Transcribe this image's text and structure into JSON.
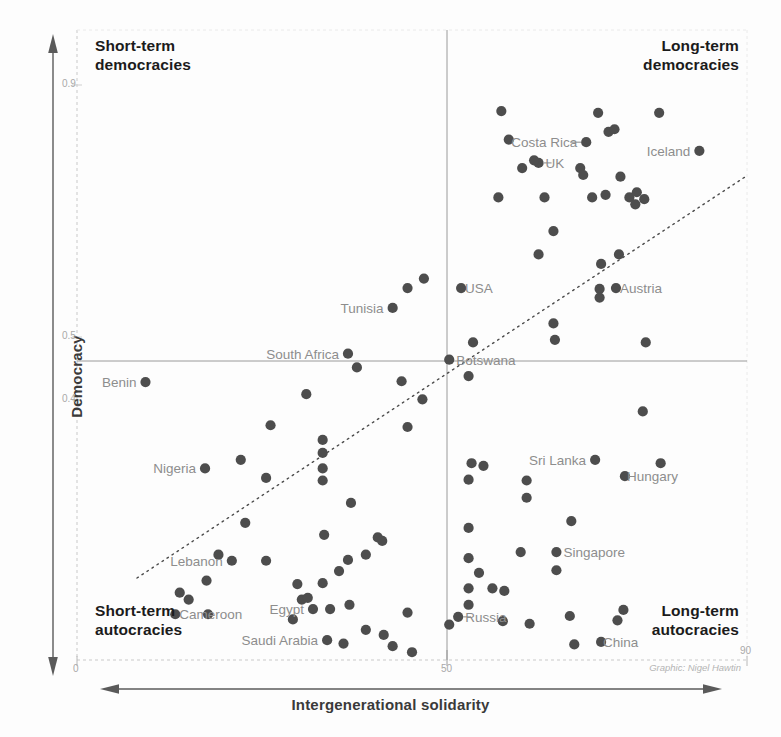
{
  "chart_data": {
    "type": "scatter",
    "title": "",
    "xlabel": "Intergenerational solidarity",
    "ylabel": "Democracy",
    "xlim": [
      0,
      90
    ],
    "ylim": [
      0.23,
      0.96
    ],
    "xticks": [
      "0",
      "50",
      "90"
    ],
    "xtick_values": [
      0,
      50,
      90
    ],
    "yticks": [
      "0.9",
      "0.5",
      "0.4"
    ],
    "ytick_values": [
      0.9,
      0.5,
      0.4
    ],
    "grid": false,
    "legend": null,
    "credit": "Graphic: Nigel Hawtin",
    "reference_lines": {
      "vertical_x": 50,
      "horizontal_y": 0.462,
      "trend_description": "dotted rising diagonal trend line",
      "trend_x": [
        8,
        86
      ],
      "trend_y": [
        0.266,
        0.706
      ]
    },
    "quadrants": {
      "top_left": "Short-term\ndemocracies",
      "top_right": "Long-term\ndemocracies",
      "bottom_left": "Short-term\nautocracies",
      "bottom_right": "Long-term\nautocracies"
    },
    "labeled_points": [
      {
        "name": "Benin",
        "x": 9.2,
        "y": 0.552,
        "anchor": "right",
        "dx": -9
      },
      {
        "name": "Nigeria",
        "x": 17.2,
        "y": 0.452,
        "anchor": "right",
        "dx": -9
      },
      {
        "name": "South Africa",
        "x": 36.4,
        "y": 0.585,
        "anchor": "right",
        "dx": -9
      },
      {
        "name": "Tunisia",
        "x": 42.4,
        "y": 0.638,
        "anchor": "right",
        "dx": -9
      },
      {
        "name": "Lebanon",
        "x": 20.8,
        "y": 0.345,
        "anchor": "right",
        "dx": -9
      },
      {
        "name": "Cameroon",
        "x": 13.2,
        "y": 0.283,
        "anchor": "left",
        "dx": 4
      },
      {
        "name": "Egypt",
        "x": 31.7,
        "y": 0.289,
        "anchor": "right",
        "dx": -9
      },
      {
        "name": "Saudi Arabia",
        "x": 33.6,
        "y": 0.253,
        "anchor": "right",
        "dx": -9
      },
      {
        "name": "USA",
        "x": 51.6,
        "y": 0.661,
        "anchor": "left",
        "dx": 4
      },
      {
        "name": "Botswana",
        "x": 50.0,
        "y": 0.578,
        "anchor": "left",
        "dx": 7
      },
      {
        "name": "Costa Rica",
        "x": 68.4,
        "y": 0.83,
        "anchor": "right",
        "dx": -9
      },
      {
        "name": "UK",
        "x": 62.0,
        "y": 0.806,
        "anchor": "left",
        "dx": 7
      },
      {
        "name": "Iceland",
        "x": 83.6,
        "y": 0.82,
        "anchor": "right",
        "dx": -9
      },
      {
        "name": "Austria",
        "x": 72.4,
        "y": 0.661,
        "anchor": "left",
        "dx": 4
      },
      {
        "name": "Sri Lanka",
        "x": 69.6,
        "y": 0.462,
        "anchor": "right",
        "dx": -9
      },
      {
        "name": "Hungary",
        "x": 73.6,
        "y": 0.443,
        "anchor": "left",
        "dx": 2
      },
      {
        "name": "Singapore",
        "x": 64.4,
        "y": 0.355,
        "anchor": "left",
        "dx": 7
      },
      {
        "name": "Russia",
        "x": 51.2,
        "y": 0.28,
        "anchor": "left",
        "dx": 7
      },
      {
        "name": "China",
        "x": 70.4,
        "y": 0.251,
        "anchor": "left",
        "dx": 2
      }
    ],
    "points": [
      [
        9.2,
        0.552
      ],
      [
        17.2,
        0.452
      ],
      [
        22.0,
        0.462
      ],
      [
        25.4,
        0.441
      ],
      [
        22.6,
        0.389
      ],
      [
        26.0,
        0.502
      ],
      [
        30.8,
        0.538
      ],
      [
        33.2,
        0.375
      ],
      [
        36.4,
        0.585
      ],
      [
        37.6,
        0.569
      ],
      [
        33.0,
        0.485
      ],
      [
        33.0,
        0.47
      ],
      [
        33.0,
        0.452
      ],
      [
        33.0,
        0.438
      ],
      [
        36.8,
        0.412
      ],
      [
        40.4,
        0.372
      ],
      [
        42.4,
        0.638
      ],
      [
        43.6,
        0.553
      ],
      [
        44.4,
        0.5
      ],
      [
        44.4,
        0.661
      ],
      [
        46.6,
        0.672
      ],
      [
        46.4,
        0.532
      ],
      [
        20.8,
        0.345
      ],
      [
        19.0,
        0.352
      ],
      [
        17.4,
        0.322
      ],
      [
        15.0,
        0.3
      ],
      [
        13.8,
        0.308
      ],
      [
        13.2,
        0.283
      ],
      [
        17.6,
        0.283
      ],
      [
        25.4,
        0.345
      ],
      [
        29.6,
        0.318
      ],
      [
        30.2,
        0.3
      ],
      [
        31.0,
        0.302
      ],
      [
        33.0,
        0.319
      ],
      [
        35.2,
        0.333
      ],
      [
        36.4,
        0.346
      ],
      [
        38.8,
        0.352
      ],
      [
        41.0,
        0.368
      ],
      [
        31.7,
        0.289
      ],
      [
        29.0,
        0.277
      ],
      [
        34.0,
        0.289
      ],
      [
        36.6,
        0.294
      ],
      [
        33.6,
        0.253
      ],
      [
        35.8,
        0.249
      ],
      [
        38.8,
        0.265
      ],
      [
        41.2,
        0.259
      ],
      [
        42.4,
        0.246
      ],
      [
        44.4,
        0.285
      ],
      [
        45.0,
        0.239
      ],
      [
        50.0,
        0.578
      ],
      [
        51.6,
        0.661
      ],
      [
        53.2,
        0.598
      ],
      [
        52.6,
        0.559
      ],
      [
        53.0,
        0.458
      ],
      [
        54.6,
        0.455
      ],
      [
        52.6,
        0.439
      ],
      [
        52.6,
        0.383
      ],
      [
        52.6,
        0.348
      ],
      [
        54.0,
        0.331
      ],
      [
        52.6,
        0.313
      ],
      [
        52.6,
        0.294
      ],
      [
        51.2,
        0.28
      ],
      [
        50.0,
        0.271
      ],
      [
        55.8,
        0.313
      ],
      [
        57.4,
        0.31
      ],
      [
        57.2,
        0.275
      ],
      [
        59.6,
        0.355
      ],
      [
        60.4,
        0.438
      ],
      [
        60.4,
        0.418
      ],
      [
        60.8,
        0.272
      ],
      [
        62.0,
        0.806
      ],
      [
        61.4,
        0.809
      ],
      [
        58.0,
        0.833
      ],
      [
        59.8,
        0.8
      ],
      [
        56.6,
        0.766
      ],
      [
        57.0,
        0.866
      ],
      [
        62.8,
        0.766
      ],
      [
        64.0,
        0.727
      ],
      [
        62.0,
        0.7
      ],
      [
        64.4,
        0.355
      ],
      [
        64.4,
        0.334
      ],
      [
        64.2,
        0.601
      ],
      [
        64.0,
        0.62
      ],
      [
        68.4,
        0.83
      ],
      [
        67.6,
        0.8
      ],
      [
        68.0,
        0.792
      ],
      [
        70.0,
        0.864
      ],
      [
        71.4,
        0.842
      ],
      [
        72.2,
        0.845
      ],
      [
        69.2,
        0.766
      ],
      [
        70.4,
        0.689
      ],
      [
        70.2,
        0.66
      ],
      [
        70.2,
        0.65
      ],
      [
        71.0,
        0.769
      ],
      [
        73.0,
        0.79
      ],
      [
        74.2,
        0.766
      ],
      [
        75.2,
        0.772
      ],
      [
        72.4,
        0.661
      ],
      [
        72.8,
        0.7
      ],
      [
        75.0,
        0.758
      ],
      [
        76.2,
        0.764
      ],
      [
        78.2,
        0.864
      ],
      [
        83.6,
        0.82
      ],
      [
        76.4,
        0.598
      ],
      [
        76.0,
        0.518
      ],
      [
        69.6,
        0.462
      ],
      [
        73.6,
        0.443
      ],
      [
        78.4,
        0.458
      ],
      [
        66.4,
        0.391
      ],
      [
        70.4,
        0.251
      ],
      [
        72.6,
        0.276
      ],
      [
        66.8,
        0.248
      ],
      [
        73.4,
        0.288
      ],
      [
        66.2,
        0.281
      ]
    ]
  },
  "axes": {
    "y_title": "Democracy",
    "x_title": "Intergenerational solidarity"
  }
}
